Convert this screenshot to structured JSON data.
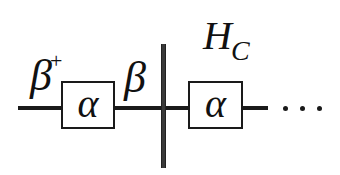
{
  "diagram": {
    "type": "tensor-network / circuit diagram",
    "labels": {
      "left_bond": "β",
      "left_bond_superscript": "+",
      "middle_bond": "β",
      "cut_label": "H",
      "cut_label_subscript": "C",
      "continuation": "···"
    },
    "boxes": [
      {
        "id": "box-1",
        "label": "α"
      },
      {
        "id": "box-2",
        "label": "α"
      }
    ],
    "colors": {
      "line": "#1a1a1a",
      "cut_bar": "#3a3a3a",
      "background": "#ffffff"
    }
  }
}
